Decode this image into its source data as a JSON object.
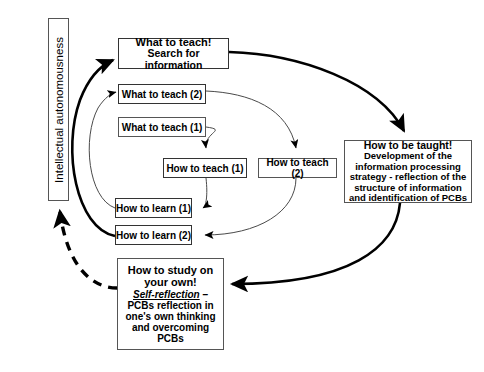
{
  "diagram": {
    "background_color": "#ffffff",
    "line_color": "#000000",
    "box_border_color": "#555555",
    "axis": {
      "label": "Intellectual autonomousness"
    },
    "nodes": {
      "what_to_teach_main": {
        "title": "What to teach!",
        "subtitle": "Search for information"
      },
      "what_to_teach_2": {
        "label": "What to teach (2)"
      },
      "what_to_teach_1": {
        "label": "What to teach (1)"
      },
      "how_to_teach_1": {
        "label": "How to teach (1)"
      },
      "how_to_teach_2": {
        "label": "How to teach (2)"
      },
      "how_to_learn_1": {
        "label": "How to learn (1)"
      },
      "how_to_learn_2": {
        "label": "How to learn (2)"
      },
      "how_to_be_taught": {
        "title": "How to be taught!",
        "body": "Development of the information processing strategy - reflection of the structure of information and identification of PCBs"
      },
      "how_to_study": {
        "title_line_1": "How to study on",
        "title_line_2": "your own!",
        "self_reflection": "Self-reflection",
        "self_reflection_dash": " –",
        "body": "PCBs reflection in one's own thinking and overcoming PCBs"
      }
    },
    "edges": [
      {
        "name": "what-to-teach-main-to-how-to-be-taught",
        "style": "thick-curve",
        "from": "what_to_teach_main",
        "to": "how_to_be_taught"
      },
      {
        "name": "what-to-teach-2-to-how-to-teach-2",
        "style": "thin-curve",
        "from": "what_to_teach_2",
        "to": "how_to_teach_2"
      },
      {
        "name": "what-to-teach-1-to-how-to-teach-1",
        "style": "thin-curve",
        "from": "what_to_teach_1",
        "to": "how_to_teach_1"
      },
      {
        "name": "how-to-teach-1-to-how-to-learn-1",
        "style": "thin-curve",
        "from": "how_to_teach_1",
        "to": "how_to_learn_1"
      },
      {
        "name": "how-to-teach-2-to-how-to-learn-2",
        "style": "thin-curve",
        "from": "how_to_teach_2",
        "to": "how_to_learn_2"
      },
      {
        "name": "how-to-learn-1-to-what-to-teach-2",
        "style": "thin-curve",
        "from": "how_to_learn_1",
        "to": "what_to_teach_2"
      },
      {
        "name": "how-to-learn-2-to-what-to-teach-main",
        "style": "thick-curve",
        "from": "how_to_learn_2",
        "to": "what_to_teach_main"
      },
      {
        "name": "how-to-be-taught-to-how-to-study",
        "style": "thick-curve",
        "from": "how_to_be_taught",
        "to": "how_to_study"
      },
      {
        "name": "how-to-study-to-autonomousness",
        "style": "dashed-thick-curve",
        "from": "how_to_study",
        "to": "axis"
      }
    ]
  }
}
